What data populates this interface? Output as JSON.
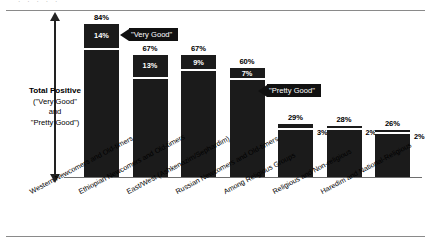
{
  "page": {
    "cropped_header_text": "· ·  ·   ·      ·"
  },
  "axis": {
    "title": "Total Positive",
    "line2": "(\"Very Good\"",
    "line3": "and",
    "line4": "\"Pretty Good\")"
  },
  "callouts": {
    "very_good": "\"Very Good\"",
    "pretty_good": "\"Pretty Good\""
  },
  "chart_data": {
    "type": "bar",
    "title": "",
    "subtitle": "",
    "xlabel": "",
    "ylabel": "Total Positive (\"Very Good\" and \"Pretty Good\")",
    "ylim": [
      0,
      100
    ],
    "grid": false,
    "legend_position": "none",
    "stacked": true,
    "value_unit": "%",
    "categories": [
      "Western Newcomers and Old-timers",
      "Ethiopian Newcomers and Old-timers",
      "East/West (Ashkenazim/Sephardim)",
      "Russian Newcomers and Old-timers",
      "Among Religious Groups",
      "Religious and Non-religious",
      "Haredim and National-Religious"
    ],
    "series": [
      {
        "name": "\"Very Good\"",
        "values": [
          14,
          13,
          9,
          7,
          3,
          2,
          2
        ],
        "labels": [
          "14%",
          "13%",
          "9%",
          "7%",
          "3%",
          "2%",
          "2%"
        ],
        "label_placement": [
          "inside",
          "inside",
          "inside",
          "inside",
          "outside",
          "outside",
          "outside"
        ]
      },
      {
        "name": "\"Pretty Good\"",
        "values": [
          70,
          54,
          58,
          53,
          26,
          26,
          24
        ]
      }
    ],
    "totals": [
      84,
      67,
      67,
      60,
      29,
      28,
      26
    ],
    "total_labels": [
      "84%",
      "67%",
      "67%",
      "60%",
      "29%",
      "28%",
      "26%"
    ],
    "annotations": [
      {
        "text": "\"Very Good\"",
        "points_to": "top segment of bar 1"
      },
      {
        "text": "\"Pretty Good\"",
        "points_to": "lower segment of bar 4"
      }
    ],
    "colors": {
      "bar": "#1b1b1b",
      "segment_divider": "#ffffff",
      "baseline": "#6e6e6e",
      "text": "#000000",
      "callout_bg": "#111111",
      "callout_text": "#ffffff",
      "background": "#ffffff"
    }
  }
}
